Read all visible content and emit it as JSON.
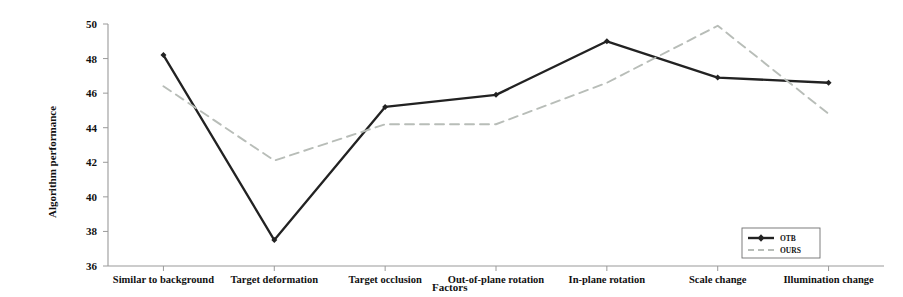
{
  "chart_data": {
    "type": "line",
    "title": "",
    "xlabel": "Factors",
    "ylabel": "Algorithm performance",
    "categories": [
      "Similar to background",
      "Target deformation",
      "Target occlusion",
      "Out-of-plane rotation",
      "In-plane rotation",
      "Scale change",
      "Illumination change"
    ],
    "series": [
      {
        "name": "OTB",
        "values": [
          48.2,
          37.5,
          45.2,
          45.9,
          49.0,
          46.9,
          46.6
        ],
        "style": "solid",
        "color": "#222222",
        "marker": "diamond"
      },
      {
        "name": "OURS",
        "values": [
          46.4,
          42.1,
          44.2,
          44.2,
          46.6,
          49.9,
          44.8
        ],
        "style": "dashed",
        "color": "#b8bdb8",
        "marker": "none"
      }
    ],
    "ylim": [
      36,
      50
    ],
    "yticks": [
      36,
      38,
      40,
      42,
      44,
      46,
      48,
      50
    ],
    "grid": false,
    "legend_position": "bottom-right",
    "axis_color": "#9a9a9a"
  },
  "legend": {
    "items": [
      {
        "label": "OTB"
      },
      {
        "label": "OURS"
      }
    ]
  }
}
